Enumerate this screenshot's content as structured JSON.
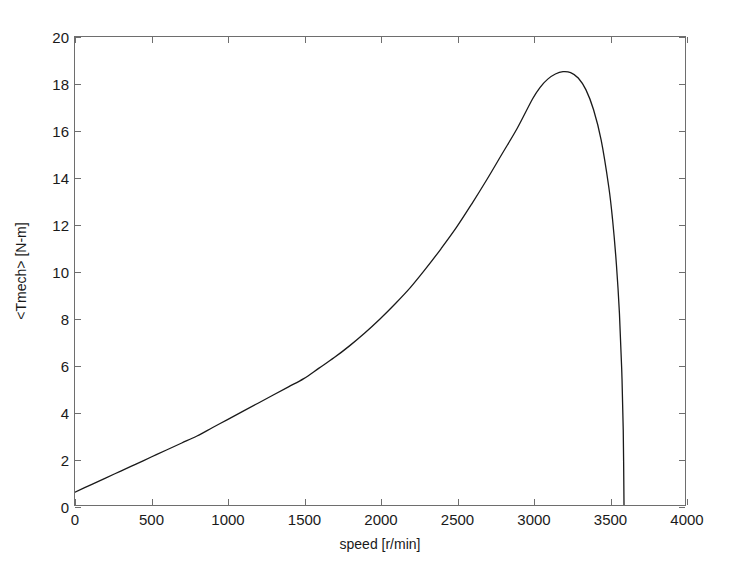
{
  "chart_data": {
    "type": "line",
    "title": "",
    "xlabel": "speed [r/min]",
    "ylabel": "<Tmech> [N-m]",
    "xlim": [
      0,
      4000
    ],
    "ylim": [
      0,
      20
    ],
    "xticks": [
      0,
      500,
      1000,
      1500,
      2000,
      2500,
      3000,
      3500,
      4000
    ],
    "yticks": [
      0,
      2,
      4,
      6,
      8,
      10,
      12,
      14,
      16,
      18,
      20
    ],
    "grid": false,
    "legend": null,
    "series": [
      {
        "name": "Tmech",
        "color": "#1a1a1a",
        "x": [
          0,
          100,
          200,
          300,
          400,
          500,
          600,
          700,
          800,
          900,
          1000,
          1100,
          1200,
          1300,
          1400,
          1500,
          1600,
          1700,
          1800,
          1900,
          2000,
          2100,
          2200,
          2300,
          2400,
          2500,
          2600,
          2700,
          2800,
          2900,
          3000,
          3050,
          3100,
          3150,
          3200,
          3250,
          3300,
          3350,
          3400,
          3450,
          3500,
          3525,
          3550,
          3570,
          3585,
          3595,
          3600
        ],
        "y": [
          0.55,
          0.85,
          1.15,
          1.45,
          1.75,
          2.05,
          2.35,
          2.65,
          2.95,
          3.3,
          3.65,
          4.0,
          4.35,
          4.7,
          5.05,
          5.4,
          5.85,
          6.3,
          6.8,
          7.35,
          7.95,
          8.6,
          9.3,
          10.1,
          10.95,
          11.85,
          12.85,
          13.9,
          15.0,
          16.1,
          17.35,
          17.85,
          18.2,
          18.42,
          18.52,
          18.48,
          18.25,
          17.75,
          16.9,
          15.6,
          13.6,
          12.2,
          10.3,
          8.2,
          5.8,
          3.2,
          0.0
        ]
      }
    ]
  },
  "axes": {
    "y_tick_labels": [
      "0",
      "2",
      "4",
      "6",
      "8",
      "10",
      "12",
      "14",
      "16",
      "18",
      "20"
    ],
    "x_tick_labels": [
      "0",
      "500",
      "1000",
      "1500",
      "2000",
      "2500",
      "3000",
      "3500",
      "4000"
    ]
  }
}
